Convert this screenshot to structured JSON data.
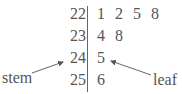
{
  "diagram": {
    "type": "stem-and-leaf",
    "rows": [
      {
        "stem": "22",
        "leaves": [
          "1",
          "2",
          "5",
          "8"
        ]
      },
      {
        "stem": "23",
        "leaves": [
          "4",
          "8"
        ]
      },
      {
        "stem": "24",
        "leaves": [
          "5"
        ]
      },
      {
        "stem": "25",
        "leaves": [
          "6"
        ]
      }
    ],
    "annotations": {
      "stem_label": "stem",
      "leaf_label": "leaf"
    }
  }
}
